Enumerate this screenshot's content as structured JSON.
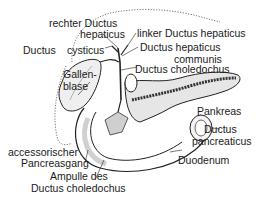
{
  "diagram": {
    "type": "anatomical illustration",
    "labels": {
      "rechter_ductus_hepaticus_1": "rechter Ductus",
      "rechter_ductus_hepaticus_2": "hepaticus",
      "linker_ductus_hepaticus": "linker Ductus hepaticus",
      "ductus_cysticus_1": "Ductus",
      "ductus_cysticus_2": "cysticus",
      "ductus_hepaticus_communis_1": "Ductus hepaticus",
      "ductus_hepaticus_communis_2": "communis",
      "ductus_choledochus": "Ductus choledochus",
      "gallenblase_1": "Gallen-",
      "gallenblase_2": "blase",
      "pankreas": "Pankreas",
      "ductus_pancreaticus_1": "Ductus",
      "ductus_pancreaticus_2": "pancreaticus",
      "duodenum": "Duodenum",
      "accessorischer_pancreasgang_1": "accessorischer",
      "accessorischer_pancreasgang_2": "Pancreasgang",
      "ampulle_1": "Ampulle des",
      "ampulle_2": "Ductus choledochus"
    }
  }
}
